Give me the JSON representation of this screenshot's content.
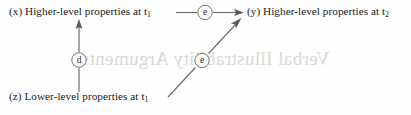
{
  "figure": {
    "background_color": "#fefefe",
    "line_color": "#6e6b68",
    "text_color": "#1a1a1a",
    "bleed_color": "#d7d2cc"
  },
  "nodes": {
    "x": {
      "marker": "(x)",
      "text": "Higher-level properties at t",
      "subscript": "1"
    },
    "y": {
      "marker": "(y)",
      "text": "Higher-level properties at t",
      "subscript": "2"
    },
    "z": {
      "marker": "(z)",
      "text": "Lower-level properties at t",
      "subscript": "1"
    }
  },
  "edges": [
    {
      "id": "x-to-y",
      "label": "e",
      "from": "x",
      "to": "y",
      "style": "horizontal-arrow"
    },
    {
      "id": "z-to-x",
      "label": "d",
      "from": "z",
      "to": "x",
      "style": "vertical-arrow"
    },
    {
      "id": "z-to-y",
      "label": "e",
      "from": "z",
      "to": "y",
      "style": "diagonal-arrow"
    }
  ],
  "bleed_through": {
    "text": "Verbal Illustrability Arguments"
  }
}
